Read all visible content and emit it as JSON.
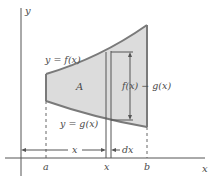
{
  "figure": {
    "axes": {
      "x_label": "x",
      "y_label": "y"
    },
    "curves": {
      "top_label": "y = f(x)",
      "bottom_label": "y = g(x)"
    },
    "region_label": "A",
    "strip": {
      "height_label": "f(x) − g(x)",
      "width_label": "dx"
    },
    "ticks": {
      "a": "a",
      "x": "x",
      "b": "b"
    },
    "distance_label": "x",
    "colors": {
      "region_fill": "#dcdcdc",
      "curve_stroke": "#7a7a7a",
      "axis": "#555555",
      "text": "#4a4a4a"
    }
  }
}
